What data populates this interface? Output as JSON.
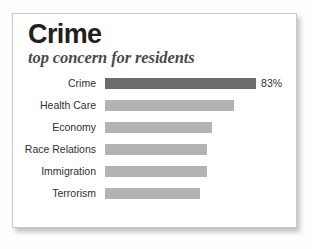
{
  "card": {
    "title": "Crime",
    "subtitle": "top concern for residents"
  },
  "colors": {
    "highlight_bar": "#6d6d6d",
    "bar": "#b3b3b3",
    "card_background": "#ffffff",
    "card_border": "#c9c9c9",
    "title_text": "#231f20",
    "subtitle_text": "#4a4a4a",
    "label_text": "#2f2f2f"
  },
  "chart_data": {
    "type": "bar",
    "orientation": "horizontal",
    "title": "Crime",
    "subtitle": "top concern for residents",
    "xlabel": "",
    "ylabel": "",
    "xlim": [
      0,
      100
    ],
    "grid": false,
    "legend": null,
    "categories": [
      "Crime",
      "Health Care",
      "Economy",
      "Race Relations",
      "Immigration",
      "Terrorism"
    ],
    "values": [
      83,
      71,
      59,
      56,
      56,
      52
    ],
    "data_labels": [
      "83%",
      "",
      "",
      "",
      "",
      ""
    ],
    "highlighted": [
      true,
      false,
      false,
      false,
      false,
      false
    ],
    "bars": [
      {
        "label": "Crime",
        "value": 83,
        "data_label": "83%",
        "highlight": true
      },
      {
        "label": "Health Care",
        "value": 71,
        "data_label": "",
        "highlight": false
      },
      {
        "label": "Economy",
        "value": 59,
        "data_label": "",
        "highlight": false
      },
      {
        "label": "Race Relations",
        "value": 56,
        "data_label": "",
        "highlight": false
      },
      {
        "label": "Immigration",
        "value": 56,
        "data_label": "",
        "highlight": false
      },
      {
        "label": "Terrorism",
        "value": 52,
        "data_label": "",
        "highlight": false
      }
    ]
  }
}
